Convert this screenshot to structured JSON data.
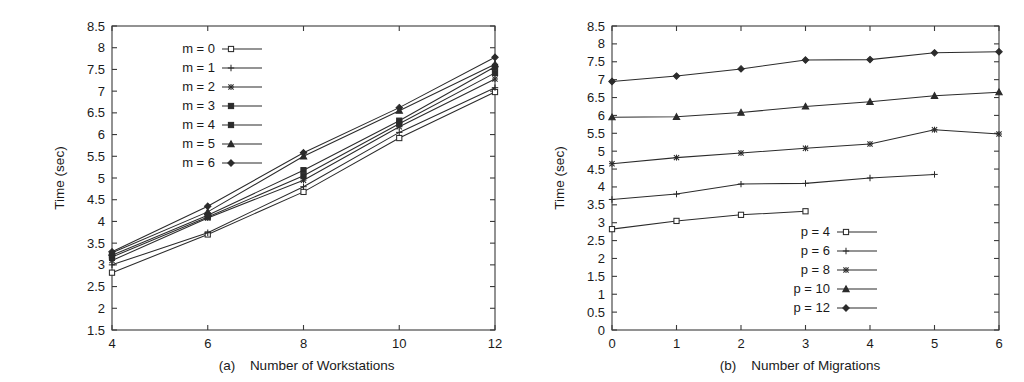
{
  "figure": {
    "background": "#ffffff",
    "ink_color": "#2b2b2b"
  },
  "panels": [
    {
      "id": "panel-a",
      "caption_tag": "(a)",
      "caption_text": "Number of Workstations",
      "ylabel": "Time (sec)",
      "xticks": [
        "4",
        "6",
        "8",
        "10",
        "12"
      ],
      "yticks": [
        "1.5",
        "2",
        "2.5",
        "3",
        "3.5",
        "4",
        "4.5",
        "5",
        "5.5",
        "6",
        "6.5",
        "7",
        "7.5",
        "8",
        "8.5"
      ],
      "legend_position": "top-left",
      "legend": [
        {
          "label": "m = 0",
          "marker": "open-square"
        },
        {
          "label": "m = 1",
          "marker": "plus"
        },
        {
          "label": "m = 2",
          "marker": "asterisk"
        },
        {
          "label": "m = 3",
          "marker": "filled-square"
        },
        {
          "label": "m = 4",
          "marker": "filled-square"
        },
        {
          "label": "m = 5",
          "marker": "triangle"
        },
        {
          "label": "m = 6",
          "marker": "diamond"
        }
      ]
    },
    {
      "id": "panel-b",
      "caption_tag": "(b)",
      "caption_text": "Number of Migrations",
      "ylabel": "Time (sec)",
      "xticks": [
        "0",
        "1",
        "2",
        "3",
        "4",
        "5",
        "6"
      ],
      "yticks": [
        "0",
        "0.5",
        "1",
        "1.5",
        "2",
        "2.5",
        "3",
        "3.5",
        "4",
        "4.5",
        "5",
        "5.5",
        "6",
        "6.5",
        "7",
        "7.5",
        "8",
        "8.5"
      ],
      "legend_position": "bottom-right",
      "legend": [
        {
          "label": "p = 4",
          "marker": "open-square"
        },
        {
          "label": "p = 6",
          "marker": "plus"
        },
        {
          "label": "p = 8",
          "marker": "asterisk"
        },
        {
          "label": "p = 10",
          "marker": "triangle"
        },
        {
          "label": "p = 12",
          "marker": "diamond"
        }
      ]
    }
  ],
  "chart_data": [
    {
      "type": "line",
      "title": "(a) Number of Workstations",
      "xlabel": "Number of Workstations",
      "ylabel": "Time (sec)",
      "x": [
        4,
        6,
        8,
        10,
        12
      ],
      "xlim": [
        4,
        12
      ],
      "ylim": [
        1.5,
        8.5
      ],
      "grid": false,
      "legend": "top-left",
      "series": [
        {
          "name": "m = 0",
          "marker": "open-square",
          "values": [
            2.82,
            3.7,
            4.68,
            5.92,
            6.98
          ]
        },
        {
          "name": "m = 1",
          "marker": "plus",
          "values": [
            3.0,
            3.74,
            4.8,
            6.05,
            7.08
          ]
        },
        {
          "name": "m = 2",
          "marker": "asterisk",
          "values": [
            3.1,
            4.08,
            4.95,
            6.18,
            7.28
          ]
        },
        {
          "name": "m = 3",
          "marker": "filled-square",
          "values": [
            3.18,
            4.1,
            5.05,
            6.25,
            7.42
          ]
        },
        {
          "name": "m = 4",
          "marker": "filled-square",
          "values": [
            3.22,
            4.14,
            5.18,
            6.32,
            7.56
          ]
        },
        {
          "name": "m = 5",
          "marker": "triangle",
          "values": [
            3.28,
            4.22,
            5.5,
            6.55,
            7.62
          ]
        },
        {
          "name": "m = 6",
          "marker": "diamond",
          "values": [
            3.3,
            4.35,
            5.58,
            6.62,
            7.78
          ]
        }
      ]
    },
    {
      "type": "line",
      "title": "(b) Number of Migrations",
      "xlabel": "Number of Migrations",
      "ylabel": "Time (sec)",
      "x": [
        0,
        1,
        2,
        3,
        4,
        5,
        6
      ],
      "xlim": [
        0,
        6
      ],
      "ylim": [
        0,
        8.5
      ],
      "grid": false,
      "legend": "bottom-right",
      "series": [
        {
          "name": "p = 4",
          "marker": "open-square",
          "x": [
            0,
            1,
            2,
            3
          ],
          "values": [
            2.82,
            3.05,
            3.22,
            3.32
          ]
        },
        {
          "name": "p = 6",
          "marker": "plus",
          "x": [
            0,
            1,
            2,
            3,
            4,
            5
          ],
          "values": [
            3.65,
            3.8,
            4.08,
            4.1,
            4.25,
            4.35
          ]
        },
        {
          "name": "p = 8",
          "marker": "asterisk",
          "x": [
            0,
            1,
            2,
            3,
            4,
            5,
            6
          ],
          "values": [
            4.65,
            4.82,
            4.95,
            5.08,
            5.2,
            5.6,
            5.48
          ]
        },
        {
          "name": "p = 10",
          "marker": "triangle",
          "x": [
            0,
            1,
            2,
            3,
            4,
            5,
            6
          ],
          "values": [
            5.95,
            5.96,
            6.08,
            6.25,
            6.38,
            6.55,
            6.65
          ]
        },
        {
          "name": "p = 12",
          "marker": "diamond",
          "x": [
            0,
            1,
            2,
            3,
            4,
            5,
            6
          ],
          "values": [
            6.95,
            7.1,
            7.3,
            7.55,
            7.56,
            7.75,
            7.78
          ]
        }
      ]
    }
  ]
}
